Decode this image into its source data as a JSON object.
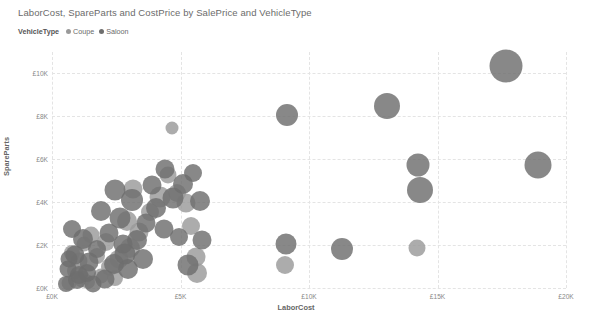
{
  "chart_data": {
    "type": "scatter",
    "title": "LaborCost, SpareParts and CostPrice by SalePrice and VehicleType",
    "xlabel": "LaborCost",
    "ylabel": "SpareParts",
    "size_label": "CostPrice",
    "xlim": [
      0,
      20000
    ],
    "ylim": [
      0,
      11000
    ],
    "grid": true,
    "legend_position": "top-left",
    "xticks": [
      {
        "value": 0,
        "label": "£0K"
      },
      {
        "value": 5000,
        "label": "£5K"
      },
      {
        "value": 10000,
        "label": "£10K"
      },
      {
        "value": 15000,
        "label": "£15K"
      },
      {
        "value": 20000,
        "label": "£20K"
      }
    ],
    "yticks": [
      {
        "value": 0,
        "label": "£0K"
      },
      {
        "value": 2000,
        "label": "£2K"
      },
      {
        "value": 4000,
        "label": "£4K"
      },
      {
        "value": 6000,
        "label": "£6K"
      },
      {
        "value": 8000,
        "label": "£8K"
      },
      {
        "value": 10000,
        "label": "£10K"
      }
    ],
    "series": [
      {
        "name": "Coupe",
        "color": "#9a9a9a",
        "points": [
          {
            "x": 680,
            "y": 250,
            "size": 15
          },
          {
            "x": 1150,
            "y": 430,
            "size": 17
          },
          {
            "x": 1420,
            "y": 290,
            "size": 14
          },
          {
            "x": 900,
            "y": 780,
            "size": 16
          },
          {
            "x": 1900,
            "y": 560,
            "size": 15
          },
          {
            "x": 2250,
            "y": 980,
            "size": 18
          },
          {
            "x": 1050,
            "y": 1250,
            "size": 17
          },
          {
            "x": 1750,
            "y": 1480,
            "size": 16
          },
          {
            "x": 2600,
            "y": 1350,
            "size": 19
          },
          {
            "x": 3050,
            "y": 1850,
            "size": 20
          },
          {
            "x": 2100,
            "y": 2150,
            "size": 18
          },
          {
            "x": 1500,
            "y": 2450,
            "size": 17
          },
          {
            "x": 3400,
            "y": 2600,
            "size": 19
          },
          {
            "x": 2900,
            "y": 3100,
            "size": 20
          },
          {
            "x": 3800,
            "y": 3550,
            "size": 18
          },
          {
            "x": 4200,
            "y": 4250,
            "size": 21
          },
          {
            "x": 3150,
            "y": 4600,
            "size": 19
          },
          {
            "x": 4850,
            "y": 4450,
            "size": 18
          },
          {
            "x": 5200,
            "y": 3950,
            "size": 19
          },
          {
            "x": 4500,
            "y": 5250,
            "size": 17
          },
          {
            "x": 5400,
            "y": 2900,
            "size": 18
          },
          {
            "x": 5600,
            "y": 1450,
            "size": 19
          },
          {
            "x": 5650,
            "y": 700,
            "size": 20
          },
          {
            "x": 9050,
            "y": 1050,
            "size": 18
          },
          {
            "x": 14200,
            "y": 1850,
            "size": 17
          },
          {
            "x": 4650,
            "y": 7450,
            "size": 13
          },
          {
            "x": 760,
            "y": 1650,
            "size": 16
          },
          {
            "x": 1250,
            "y": 2050,
            "size": 15
          },
          {
            "x": 2450,
            "y": 480,
            "size": 16
          }
        ]
      },
      {
        "name": "Saloon",
        "color": "#6e6e6e",
        "points": [
          {
            "x": 540,
            "y": 180,
            "size": 16
          },
          {
            "x": 980,
            "y": 350,
            "size": 18
          },
          {
            "x": 1600,
            "y": 200,
            "size": 17
          },
          {
            "x": 2050,
            "y": 420,
            "size": 19
          },
          {
            "x": 640,
            "y": 900,
            "size": 17
          },
          {
            "x": 1350,
            "y": 720,
            "size": 18
          },
          {
            "x": 2400,
            "y": 1100,
            "size": 20
          },
          {
            "x": 880,
            "y": 1550,
            "size": 19
          },
          {
            "x": 1750,
            "y": 1800,
            "size": 18
          },
          {
            "x": 2850,
            "y": 1600,
            "size": 21
          },
          {
            "x": 1200,
            "y": 2300,
            "size": 20
          },
          {
            "x": 2200,
            "y": 2550,
            "size": 19
          },
          {
            "x": 3300,
            "y": 2250,
            "size": 20
          },
          {
            "x": 760,
            "y": 2750,
            "size": 18
          },
          {
            "x": 2650,
            "y": 3250,
            "size": 21
          },
          {
            "x": 3650,
            "y": 3050,
            "size": 19
          },
          {
            "x": 1900,
            "y": 3600,
            "size": 20
          },
          {
            "x": 3100,
            "y": 4100,
            "size": 22
          },
          {
            "x": 4050,
            "y": 3750,
            "size": 20
          },
          {
            "x": 2450,
            "y": 4550,
            "size": 21
          },
          {
            "x": 3900,
            "y": 4800,
            "size": 19
          },
          {
            "x": 4700,
            "y": 4200,
            "size": 21
          },
          {
            "x": 5100,
            "y": 4850,
            "size": 20
          },
          {
            "x": 4400,
            "y": 5550,
            "size": 19
          },
          {
            "x": 5500,
            "y": 5350,
            "size": 18
          },
          {
            "x": 5750,
            "y": 4050,
            "size": 20
          },
          {
            "x": 5850,
            "y": 2250,
            "size": 19
          },
          {
            "x": 9100,
            "y": 2050,
            "size": 21
          },
          {
            "x": 9150,
            "y": 8050,
            "size": 22
          },
          {
            "x": 11300,
            "y": 1800,
            "size": 22
          },
          {
            "x": 13050,
            "y": 8500,
            "size": 26
          },
          {
            "x": 14250,
            "y": 5750,
            "size": 23
          },
          {
            "x": 14300,
            "y": 4550,
            "size": 26
          },
          {
            "x": 18900,
            "y": 5750,
            "size": 27
          },
          {
            "x": 17650,
            "y": 10350,
            "size": 33
          },
          {
            "x": 1450,
            "y": 1200,
            "size": 19
          },
          {
            "x": 2950,
            "y": 900,
            "size": 20
          },
          {
            "x": 4350,
            "y": 2750,
            "size": 19
          },
          {
            "x": 3550,
            "y": 1350,
            "size": 20
          },
          {
            "x": 5300,
            "y": 1050,
            "size": 21
          },
          {
            "x": 660,
            "y": 1350,
            "size": 17
          },
          {
            "x": 1050,
            "y": 600,
            "size": 18
          },
          {
            "x": 2750,
            "y": 2050,
            "size": 19
          },
          {
            "x": 4950,
            "y": 2400,
            "size": 18
          }
        ]
      }
    ]
  }
}
